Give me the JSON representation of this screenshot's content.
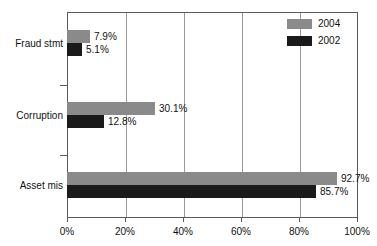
{
  "chart_data": {
    "type": "bar",
    "orientation": "horizontal",
    "title": "",
    "xlabel": "",
    "ylabel": "",
    "xlim": [
      0,
      100
    ],
    "grid": true,
    "legend_position": "top-right",
    "categories": [
      "Fraud stmt",
      "Corruption",
      "Asset mis"
    ],
    "series": [
      {
        "name": "2004",
        "color": "#8a8a8a",
        "values": [
          7.9,
          30.1,
          92.7
        ],
        "value_labels": [
          "7.9%",
          "30.1%",
          "92.7%"
        ]
      },
      {
        "name": "2002",
        "color": "#1a1a1a",
        "values": [
          5.1,
          12.8,
          85.7
        ],
        "value_labels": [
          "5.1%",
          "12.8%",
          "85.7%"
        ]
      }
    ],
    "xticks": [
      0,
      20,
      40,
      60,
      80,
      100
    ],
    "xtick_labels": [
      "0%",
      "20%",
      "40%",
      "60%",
      "80%",
      "100%"
    ]
  },
  "legend": {
    "items": [
      {
        "label": "2004",
        "color": "#8a8a8a"
      },
      {
        "label": "2002",
        "color": "#1a1a1a"
      }
    ]
  },
  "axis": {
    "x_labels": [
      "0%",
      "20%",
      "40%",
      "60%",
      "80%",
      "100%"
    ]
  },
  "categories": {
    "items": [
      {
        "label": "Fraud stmt",
        "v2004": "7.9%",
        "v2002": "5.1%"
      },
      {
        "label": "Corruption",
        "v2004": "30.1%",
        "v2002": "12.8%"
      },
      {
        "label": "Asset mis",
        "v2004": "92.7%",
        "v2002": "85.7%"
      }
    ]
  }
}
